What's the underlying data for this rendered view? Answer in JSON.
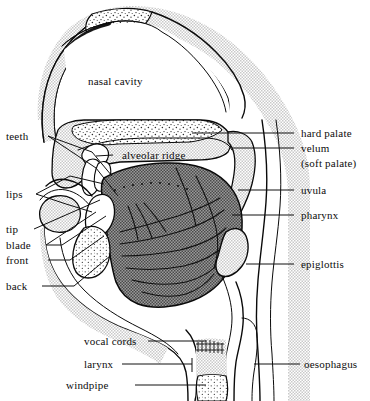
{
  "figure": {
    "type": "anatomical-diagram",
    "background_color": "#ffffff",
    "ink_color": "#0a0a0a",
    "tongue_fill": "#6e6e6e",
    "tissue_fill": "#d8d8d8",
    "bone_fill": "#ffffff"
  },
  "labels": {
    "nasal_cavity": "nasal cavity",
    "teeth": "teeth",
    "alveolar_ridge": "alveolar ridge",
    "lips": "lips",
    "tip": "tip",
    "blade": "blade",
    "front": "front",
    "back": "back",
    "vocal_cords": "vocal cords",
    "larynx": "larynx",
    "windpipe": "windpipe",
    "hard_palate": "hard palate",
    "velum": "velum",
    "soft_palate": "(soft palate)",
    "uvula": "uvula",
    "pharynx": "pharynx",
    "epiglottis": "epiglottis",
    "oesophagus": "oesophagus"
  },
  "label_groups": {
    "left": [
      "teeth",
      "lips",
      "tip",
      "blade",
      "front",
      "back",
      "vocal cords",
      "larynx",
      "windpipe"
    ],
    "right": [
      "hard palate",
      "velum",
      "(soft palate)",
      "uvula",
      "pharynx",
      "epiglottis",
      "oesophagus"
    ],
    "inner": [
      "nasal cavity",
      "alveolar ridge"
    ]
  }
}
